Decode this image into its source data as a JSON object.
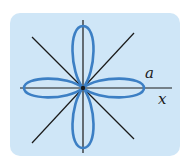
{
  "diagram": {
    "type": "polar-rose-curve",
    "labels": {
      "a": "a",
      "x": "x"
    },
    "colors": {
      "panel_background": "#cfe6f7",
      "curve": "#3c7fc4",
      "axes": "#1a1a1a"
    },
    "center": [
      83,
      88
    ],
    "petal_length": 60,
    "petal_half_width": 11
  }
}
